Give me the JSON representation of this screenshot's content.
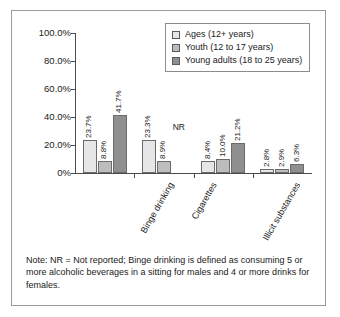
{
  "chart_data": {
    "type": "bar",
    "title": "",
    "xlabel": "",
    "ylabel": "",
    "ylim": [
      0,
      100
    ],
    "grid": false,
    "legend_position": "top-right",
    "categories": [
      "Binge drinking",
      "Cigarettes",
      "Illicit substances",
      "Prescription drugs"
    ],
    "y_ticks": [
      "0%",
      "20.0%",
      "40.0%",
      "60.0%",
      "80.0%",
      "100.0%"
    ],
    "y_tick_values": [
      0,
      20,
      40,
      60,
      80,
      100
    ],
    "series": [
      {
        "name": "Ages (12+ years)",
        "color": "#e6e6e6",
        "values": [
          23.7,
          23.3,
          8.4,
          2.8
        ],
        "labels": [
          "23.7%",
          "23.3%",
          "8.4%",
          "2.8%"
        ]
      },
      {
        "name": "Youth (12 to 17 years)",
        "color": "#bdbdbd",
        "values": [
          8.8,
          8.9,
          10.0,
          2.9
        ],
        "labels": [
          "8.8%",
          "8.9%",
          "10.0%",
          "2.9%"
        ]
      },
      {
        "name": "Young adults (18 to 25 years)",
        "color": "#8f8f8f",
        "values": [
          41.7,
          null,
          21.2,
          6.3
        ],
        "labels": [
          "41.7%",
          "NR",
          "21.2%",
          "6.3%"
        ]
      }
    ],
    "annotations": [
      {
        "text": "NR",
        "series": "Young adults (18 to 25 years)",
        "category": "Cigarettes"
      }
    ]
  },
  "legend": {
    "items": [
      {
        "label": "Ages (12+ years)",
        "color": "#e6e6e6"
      },
      {
        "label": "Youth (12 to 17 years)",
        "color": "#bdbdbd"
      },
      {
        "label": "Young adults (18 to 25 years)",
        "color": "#8f8f8f"
      }
    ]
  },
  "note": {
    "text": "Note: NR = Not reported; Binge drinking is defined as consuming 5 or more alcoholic beverages in a sitting for males and 4 or more drinks for females."
  }
}
